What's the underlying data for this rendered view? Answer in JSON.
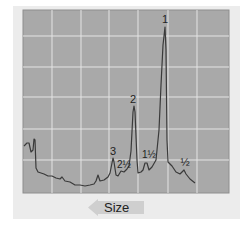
{
  "chart_data": {
    "type": "line",
    "title": "",
    "xlabel": "Size",
    "xlabel_arrow_direction": "left",
    "ylabel": "",
    "grid": true,
    "colors": {
      "frame": "#ececec",
      "plot_bg": "#a9a9a9",
      "grid": "#e4e4e4",
      "trace": "#3a3a3a",
      "arrow": "#cfcfcf"
    },
    "peak_labels": [
      {
        "label": "1",
        "x": 165,
        "y": 23
      },
      {
        "label": "2",
        "x": 133,
        "y": 103
      },
      {
        "label": "3",
        "x": 113,
        "y": 155
      },
      {
        "label": "2½",
        "x": 124,
        "y": 168
      },
      {
        "label": "1½",
        "x": 149,
        "y": 158
      },
      {
        "label": "½",
        "x": 185,
        "y": 166
      }
    ],
    "trace_points": [
      [
        24,
        146
      ],
      [
        27,
        143
      ],
      [
        29,
        143
      ],
      [
        31,
        152
      ],
      [
        33,
        150
      ],
      [
        34,
        139
      ],
      [
        35,
        140
      ],
      [
        36,
        168
      ],
      [
        38,
        172
      ],
      [
        44,
        174
      ],
      [
        48,
        176
      ],
      [
        52,
        176
      ],
      [
        56,
        178
      ],
      [
        60,
        179
      ],
      [
        62,
        177
      ],
      [
        65,
        181
      ],
      [
        70,
        182
      ],
      [
        75,
        185
      ],
      [
        80,
        185
      ],
      [
        85,
        186
      ],
      [
        90,
        185
      ],
      [
        94,
        184
      ],
      [
        96,
        181
      ],
      [
        98,
        175
      ],
      [
        100,
        181
      ],
      [
        104,
        180
      ],
      [
        108,
        177
      ],
      [
        110,
        173
      ],
      [
        112,
        163
      ],
      [
        113,
        158
      ],
      [
        114,
        162
      ],
      [
        116,
        175
      ],
      [
        118,
        176
      ],
      [
        121,
        171
      ],
      [
        124,
        172
      ],
      [
        127,
        169
      ],
      [
        129,
        166
      ],
      [
        131,
        151
      ],
      [
        133,
        112
      ],
      [
        134,
        106
      ],
      [
        135,
        112
      ],
      [
        137,
        160
      ],
      [
        138,
        173
      ],
      [
        141,
        172
      ],
      [
        143,
        170
      ],
      [
        145,
        163
      ],
      [
        147,
        163
      ],
      [
        149,
        170
      ],
      [
        152,
        167
      ],
      [
        156,
        160
      ],
      [
        159,
        130
      ],
      [
        161,
        85
      ],
      [
        163,
        45
      ],
      [
        165,
        27
      ],
      [
        166,
        50
      ],
      [
        167,
        140
      ],
      [
        168,
        162
      ],
      [
        172,
        166
      ],
      [
        176,
        172
      ],
      [
        180,
        174
      ],
      [
        184,
        170
      ],
      [
        186,
        174
      ],
      [
        190,
        179
      ],
      [
        195,
        183
      ]
    ]
  }
}
